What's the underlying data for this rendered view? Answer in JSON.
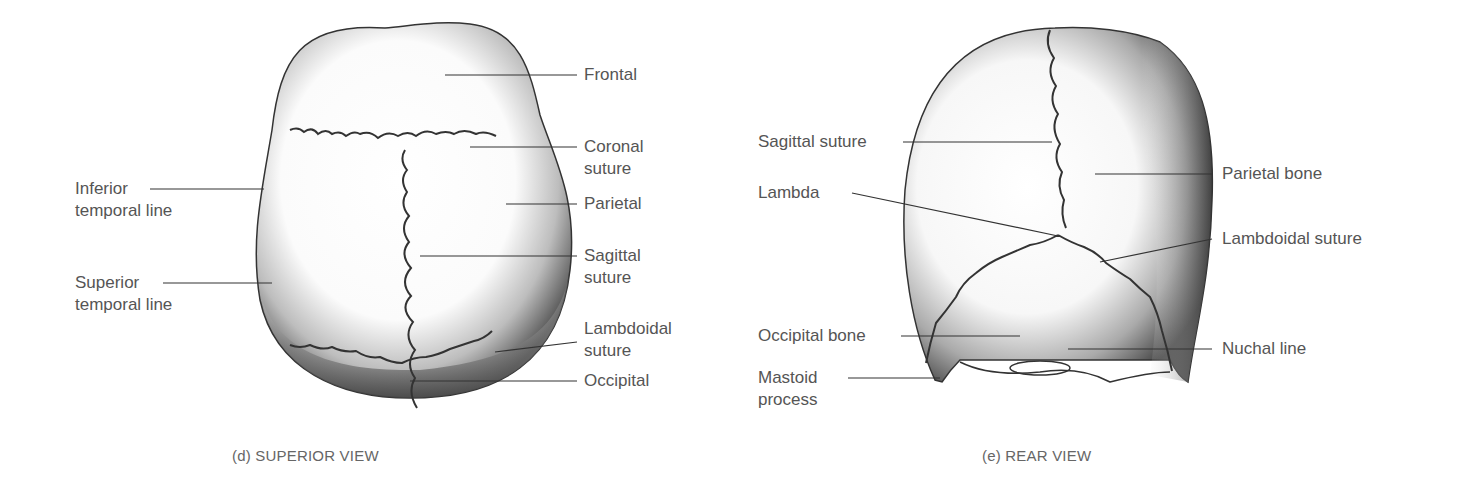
{
  "figure": {
    "panels": [
      {
        "id": "superior",
        "caption": "(d) SUPERIOR VIEW",
        "labels": [
          {
            "text": "Frontal",
            "side": "right"
          },
          {
            "text": "Coronal\nsuture",
            "side": "right"
          },
          {
            "text": "Parietal",
            "side": "right"
          },
          {
            "text": "Sagittal\nsuture",
            "side": "right"
          },
          {
            "text": "Lambdoidal\nsuture",
            "side": "right"
          },
          {
            "text": "Occipital",
            "side": "right"
          },
          {
            "text": "Inferior\ntemporal line",
            "side": "left"
          },
          {
            "text": "Superior\ntemporal line",
            "side": "left"
          }
        ]
      },
      {
        "id": "rear",
        "caption": "(e) REAR VIEW",
        "labels": [
          {
            "text": "Sagittal suture",
            "side": "left"
          },
          {
            "text": "Lambda",
            "side": "left"
          },
          {
            "text": "Occipital bone",
            "side": "left"
          },
          {
            "text": "Mastoid\nprocess",
            "side": "left"
          },
          {
            "text": "Parietal bone",
            "side": "right"
          },
          {
            "text": "Lambdoidal suture",
            "side": "right"
          },
          {
            "text": "Nuchal line",
            "side": "right"
          }
        ]
      }
    ]
  }
}
